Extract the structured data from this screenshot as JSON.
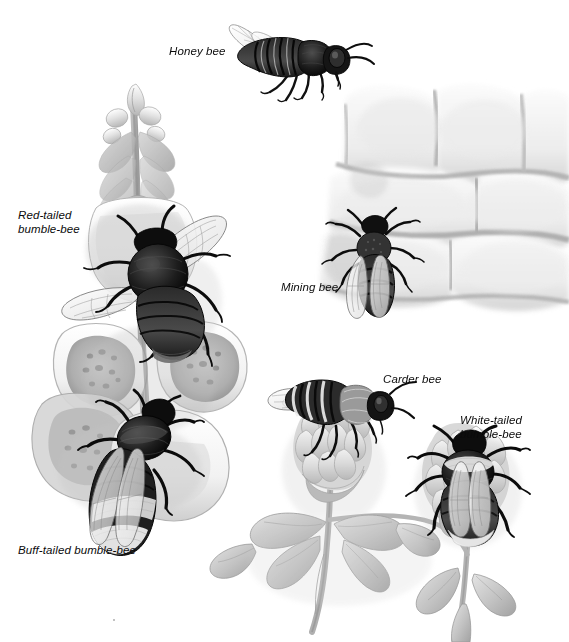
{
  "plate": {
    "kind": "natural-history-illustration",
    "subject": "British bees on flowers and wall",
    "background_color": "#ffffff",
    "ink_color": "#0b0b0b",
    "width": 569,
    "height": 642
  },
  "labels": {
    "honey_bee": "Honey bee",
    "red_tailed_bumble_bee": "Red-tailed\nbumble-bee",
    "mining_bee": "Mining bee",
    "carder_bee": "Carder bee",
    "white_tailed_bumble_bee": "White-tailed\nbumble-bee",
    "buff_tailed_bumble_bee": "Buff-tailed bumble-bee"
  },
  "figures": [
    {
      "id": "honey-bee",
      "label": "Honey bee",
      "pose": "in flight, facing right, wings raised",
      "habitat": "none, plain background"
    },
    {
      "id": "red-tailed-bumble-bee",
      "label": "Red-tailed bumble-bee",
      "pose": "dorsal view, wings spread, head up-left",
      "habitat": "foxglove spike, upper bells"
    },
    {
      "id": "mining-bee",
      "label": "Mining bee",
      "pose": "dorsal view, head up, wings folded over abdomen",
      "habitat": "brick wall with mortar joints"
    },
    {
      "id": "carder-bee",
      "label": "Carder bee",
      "pose": "side view, facing right, wings back",
      "habitat": "red clover flower head"
    },
    {
      "id": "white-tailed-bumble-bee",
      "label": "White-tailed bumble-bee",
      "pose": "dorsal view, head up, wings folded",
      "habitat": "clover flower head"
    },
    {
      "id": "buff-tailed-bumble-bee",
      "label": "Buff-tailed bumble-bee",
      "pose": "dorsal view, head up-right, wings folded",
      "habitat": "foxglove bell, lower spike"
    }
  ],
  "plants": [
    {
      "id": "foxglove",
      "name": "foxglove spike",
      "detail": "bell flowers with spotted throats, buds at apex"
    },
    {
      "id": "clover",
      "name": "red clover",
      "detail": "flower heads with trifoliate leaves"
    },
    {
      "id": "wall",
      "name": "brick wall",
      "detail": "courses of bricks with recessed mortar joints"
    }
  ],
  "colors": {
    "ink": "#0b0b0b",
    "bee_body_dark": "#1c1c1c",
    "bee_body_mid": "#4a4a4a",
    "bee_band_light": "#e8e8e8",
    "wing_membrane": "#f4f4f4",
    "wing_vein": "#9a9a9a",
    "plant_light": "#d8d8d8",
    "plant_mid": "#b2b2b2",
    "plant_dark": "#8a8a8a",
    "wall_light": "#efefef",
    "wall_shadow": "#b9b9b9",
    "background": "#ffffff"
  }
}
